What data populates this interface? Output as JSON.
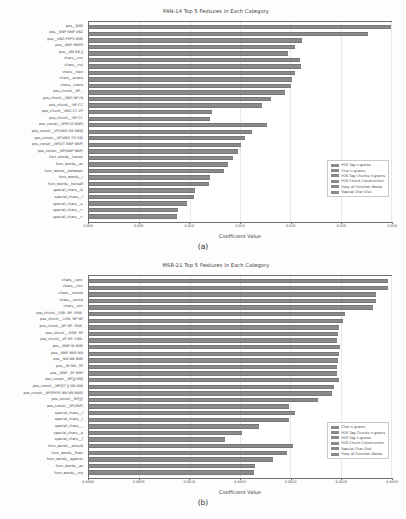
{
  "figure": {
    "panels": [
      {
        "caption": "(a)",
        "chart_data": {
          "type": "bar",
          "orientation": "horizontal",
          "title": "PAN-14 Top 5 Features in Each Category",
          "xlabel": "Coefficient Value",
          "ylabel": "",
          "xlim": [
            0.0,
            0.03
          ],
          "grid": true,
          "xticks": [
            "0.000",
            "0.005",
            "0.010",
            "0.015",
            "0.020",
            "0.025",
            "0.030"
          ],
          "xtick_values": [
            0.0,
            0.005,
            0.01,
            0.015,
            0.02,
            0.025,
            0.03
          ],
          "legend_position": "lower right",
          "legend": [
            "POS Tag n-grams",
            "Char n-grams",
            "POS Tag Chunks n-grams",
            "POS Chunk Construction",
            "Freq. of Function Words",
            "Special Char Dist."
          ],
          "categories": [
            "pos__NNS",
            "pos__NNP NNP VBZ",
            "pos__VBG PRP$ NNS",
            "pos__NNP NNPS",
            "pos__NN RB JJ",
            "chars__nur",
            "chars__nul",
            "chars__inen",
            "chars__acteis",
            "chars__ctans",
            "pos_chunk__NP _",
            "pos_chunk__VBG NP IN",
            "pos_chunk__ NP CC",
            "pos_chunk__VBG CC VP",
            "pos_chunk__ NP CC",
            "pos_constr__NPECO NNPJ",
            "pos_constr__VP|VBD RB VBN|",
            "pos_constr__VP|VBD TO VB|",
            "pos_constr__NP|DT NNP NNP|",
            "pos_constr__NP|NNP NNP|",
            "func_words__haven",
            "func_words__as",
            "func_words__between",
            "func_words__i",
            "func_words__herself",
            "special_chars__&",
            "special_chars__!",
            "special_chars__=",
            "special_chars__<",
            "special_chars__>"
          ],
          "values": [
            0.03,
            0.0277,
            0.0212,
            0.0205,
            0.0198,
            0.021,
            0.0211,
            0.0205,
            0.0202,
            0.0201,
            0.0195,
            0.0181,
            0.0172,
            0.0122,
            0.012,
            0.0177,
            0.0162,
            0.0155,
            0.0151,
            0.0148,
            0.0143,
            0.0138,
            0.0134,
            0.012,
            0.0119,
            0.0105,
            0.0104,
            0.0097,
            0.0088,
            0.0087
          ],
          "series_of_category": [
            0,
            0,
            0,
            0,
            0,
            1,
            1,
            1,
            1,
            1,
            2,
            2,
            2,
            2,
            2,
            3,
            3,
            3,
            3,
            3,
            4,
            4,
            4,
            4,
            4,
            5,
            5,
            5,
            5,
            5
          ]
        }
      },
      {
        "caption": "(b)",
        "chart_data": {
          "type": "bar",
          "orientation": "horizontal",
          "title": "MSR-21 Top 5 Features in Each Category",
          "xlabel": "Coefficient Value",
          "ylabel": "",
          "xlim": [
            0.0,
            0.003
          ],
          "grid": true,
          "xticks": [
            "0.0000",
            "0.0005",
            "0.0010",
            "0.0015",
            "0.0020",
            "0.0025",
            "0.0030"
          ],
          "xtick_values": [
            0.0,
            0.0005,
            0.001,
            0.0015,
            0.002,
            0.0025,
            0.003
          ],
          "legend_position": "lower right",
          "legend": [
            "Char n-grams",
            "POS Tag Chunks n-grams",
            "POS Tag n-grams",
            "POS Chunk Construction",
            "Special Char Dist.",
            "Freq. of Function Words"
          ],
          "categories": [
            "chars__conc",
            "chars__cinc",
            "chars__concie",
            "chars__conce",
            "chars__unc",
            "pos_chunk__LRB- NP -RRB-",
            "pos_chunk__-LRB- NP NP",
            "pos_chunk__NP NP -SUB-",
            "pos_chunk__-RRB- SP",
            "pos_chunk__VP NP -LRB-",
            "pos__NNP IN NNS",
            "pos__NNP NNS NN",
            "pos__NN NN NNS",
            "pos__IN NN _SP",
            "pos__NNS _SP NNP",
            "pos_constr__NP|JJ NN|",
            "pos_constr__NP|DT JJ NN NN|",
            "pos_constr__NP|PRP$ NN NN NNS|",
            "pos_constr__NP|JJ|",
            "pos_constr__VP|VBP|",
            "special_chars__/",
            "special_chars__|",
            "special_chars__,",
            "special_chars__a",
            "special_chars__]",
            "func_words__should",
            "func_words__from",
            "func_words__against",
            "func_words__as",
            "func_words__my"
          ],
          "values": [
            0.00297,
            0.00297,
            0.00285,
            0.00285,
            0.00282,
            0.00254,
            0.00252,
            0.00248,
            0.00247,
            0.00246,
            0.00249,
            0.00248,
            0.00247,
            0.00246,
            0.00246,
            0.00248,
            0.00243,
            0.00241,
            0.00227,
            0.00199,
            0.00205,
            0.00199,
            0.00169,
            0.00152,
            0.00135,
            0.00203,
            0.00197,
            0.00183,
            0.00165,
            0.00164
          ],
          "series_of_category": [
            0,
            0,
            0,
            0,
            0,
            1,
            1,
            1,
            1,
            1,
            2,
            2,
            2,
            2,
            2,
            3,
            3,
            3,
            3,
            3,
            4,
            4,
            4,
            4,
            4,
            5,
            5,
            5,
            5,
            5
          ]
        }
      }
    ]
  }
}
